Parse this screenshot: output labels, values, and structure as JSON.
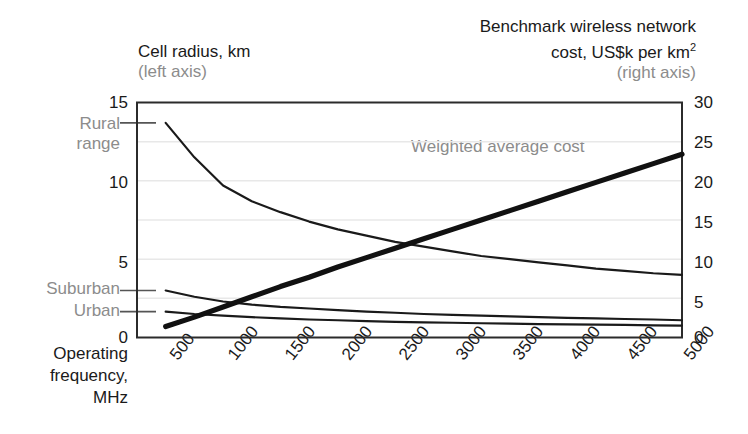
{
  "titles": {
    "left_axis_title": "Cell radius, km",
    "left_axis_note": "(left axis)",
    "right_axis_title_line1": "Benchmark wireless network",
    "right_axis_title_line2_pre": "cost, US$k per km",
    "right_axis_title_line2_sup": "2",
    "right_axis_note": "(right axis)"
  },
  "x_axis": {
    "caption_line1": "Operating",
    "caption_line2": "frequency,",
    "caption_line3": "MHz",
    "ticks": [
      "500",
      "1000",
      "1500",
      "2000",
      "2500",
      "3000",
      "3500",
      "4000",
      "4500",
      "5000"
    ],
    "min": 250,
    "max": 5000
  },
  "left_axis": {
    "ticks": [
      "0",
      "5",
      "10",
      "15"
    ],
    "min": 0,
    "max": 15,
    "named_ticks": [
      {
        "label_line1": "Rural",
        "label_line2": "range",
        "value": 13.7
      },
      {
        "label_line1": "Suburban",
        "label_line2": "",
        "value": 3.0
      },
      {
        "label_line1": "Urban",
        "label_line2": "",
        "value": 1.65
      }
    ]
  },
  "right_axis": {
    "ticks": [
      "0",
      "5",
      "10",
      "15",
      "20",
      "25",
      "30"
    ],
    "min": 0,
    "max": 30
  },
  "annotations": {
    "weighted_average_cost": "Weighted average cost"
  },
  "colors": {
    "line": "#1a1a1a",
    "grid": "#e8e8e8",
    "axis": "#2b2b2b",
    "muted_text": "#8c8c8c",
    "background": "#ffffff"
  },
  "chart_data": {
    "type": "line",
    "xlabel": "Operating frequency, MHz",
    "ylabel": "Cell radius, km",
    "y2label": "Benchmark wireless network cost, US$k per km2",
    "xlim": [
      250,
      5000
    ],
    "ylim": [
      0,
      15
    ],
    "y2lim": [
      0,
      30
    ],
    "grid": true,
    "legend": "inline-annotations",
    "x": [
      500,
      750,
      1000,
      1250,
      1500,
      1750,
      2000,
      2250,
      2500,
      2750,
      3000,
      3250,
      3500,
      3750,
      4000,
      4250,
      4500,
      4750,
      5000
    ],
    "series": [
      {
        "name": "Rural range",
        "axis": "left",
        "units": "km",
        "values": [
          13.7,
          11.5,
          9.7,
          8.7,
          8.0,
          7.4,
          6.9,
          6.5,
          6.1,
          5.8,
          5.5,
          5.2,
          5.0,
          4.8,
          4.6,
          4.4,
          4.25,
          4.1,
          4.0
        ]
      },
      {
        "name": "Suburban range",
        "axis": "left",
        "units": "km",
        "values": [
          3.0,
          2.6,
          2.3,
          2.1,
          1.95,
          1.85,
          1.75,
          1.65,
          1.58,
          1.5,
          1.45,
          1.4,
          1.35,
          1.3,
          1.25,
          1.22,
          1.18,
          1.15,
          1.1
        ]
      },
      {
        "name": "Urban range",
        "axis": "left",
        "units": "km",
        "values": [
          1.65,
          1.5,
          1.4,
          1.3,
          1.22,
          1.15,
          1.1,
          1.05,
          1.0,
          0.97,
          0.94,
          0.91,
          0.88,
          0.86,
          0.84,
          0.82,
          0.8,
          0.78,
          0.76
        ]
      },
      {
        "name": "Weighted average cost",
        "axis": "right",
        "units": "US$k per km2",
        "values": [
          1.4,
          2.6,
          3.9,
          5.2,
          6.5,
          7.7,
          9.0,
          10.2,
          11.4,
          12.6,
          13.8,
          15.0,
          16.2,
          17.4,
          18.6,
          19.8,
          21.0,
          22.2,
          23.4
        ]
      }
    ]
  }
}
